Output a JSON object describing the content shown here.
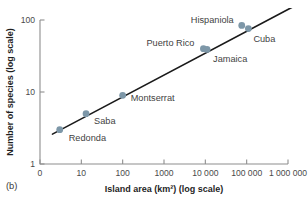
{
  "panel": {
    "label": "(b)"
  },
  "chart_data": {
    "type": "scatter",
    "title": "",
    "xlabel": "Island area (km²) (log scale)",
    "ylabel": "Number of species (log scale)",
    "xscale": "log",
    "yscale": "log",
    "grid": false,
    "legend": "none",
    "xlim": [
      1,
      1000000
    ],
    "ylim": [
      1,
      100
    ],
    "xticks": [
      1,
      10,
      100,
      1000,
      10000,
      100000,
      1000000
    ],
    "xticklabels": [
      "0",
      "10",
      "100",
      "1000",
      "10 000",
      "100 000",
      "1 000 000"
    ],
    "yticks": [
      1,
      10,
      100
    ],
    "yticklabels": [
      "1",
      "10",
      "100"
    ],
    "point_color": "#7d97a8",
    "line_color": "#1a1a1a",
    "points": [
      {
        "label": "Redonda",
        "x": 3,
        "y": 3,
        "label_dx": 9,
        "label_dy": 11,
        "anchor": "start"
      },
      {
        "label": "Saba",
        "x": 13,
        "y": 5,
        "label_dx": 8,
        "label_dy": 10,
        "anchor": "start"
      },
      {
        "label": "Montserrat",
        "x": 100,
        "y": 9,
        "label_dx": 8,
        "label_dy": 6,
        "anchor": "start"
      },
      {
        "label": "Puerto Rico",
        "x": 9000,
        "y": 40,
        "label_dx": -9,
        "label_dy": -3,
        "anchor": "end"
      },
      {
        "label": "Jamaica",
        "x": 11000,
        "y": 39,
        "label_dx": 6,
        "label_dy": 13,
        "anchor": "start"
      },
      {
        "label": "Hispaniola",
        "x": 76000,
        "y": 84,
        "label_dx": -8,
        "label_dy": -2,
        "anchor": "end"
      },
      {
        "label": "Cuba",
        "x": 110000,
        "y": 76,
        "label_dx": 5,
        "label_dy": 13,
        "anchor": "start"
      }
    ],
    "trendline": {
      "x_start": 2,
      "y_start": 2.6,
      "x_end": 1400000,
      "y_end": 155
    }
  }
}
